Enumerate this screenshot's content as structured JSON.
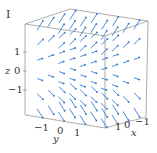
{
  "panel_label": "I",
  "chart_data": {
    "type": "vector_field_3d",
    "title": "",
    "panel": "I",
    "axes": {
      "x": {
        "label": "x",
        "ticks": [
          "1",
          "0",
          "−1"
        ],
        "range": [
          -1.5,
          1.5
        ]
      },
      "y": {
        "label": "y",
        "ticks": [
          "−1",
          "0",
          "1"
        ],
        "range": [
          -1.5,
          1.5
        ]
      },
      "z": {
        "label": "z",
        "ticks": [
          "1",
          "0",
          "−1"
        ],
        "range": [
          -1.5,
          1.5
        ]
      }
    },
    "arrow_color": "#3a7fd5",
    "box_color": "#888888"
  },
  "labels": {
    "z_axis": "z",
    "z_ticks": [
      "1",
      "0",
      "−1"
    ],
    "y_axis": "y",
    "y_ticks": [
      "−1",
      "0",
      "1"
    ],
    "x_axis": "x",
    "x_ticks": [
      "1",
      "0",
      "−1"
    ]
  }
}
